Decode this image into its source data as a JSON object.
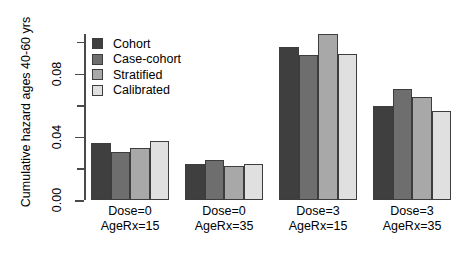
{
  "chart_data": {
    "type": "bar",
    "title": "",
    "xlabel": "",
    "ylabel": "Cumulative hazard ages 40-60 yrs",
    "ylim": [
      0.0,
      0.105
    ],
    "yticks": [
      0.0,
      0.02,
      0.04,
      0.06,
      0.08,
      0.1
    ],
    "ytick_labels": [
      "0.00",
      "0.04",
      "0.08"
    ],
    "ytick_labeled_values": [
      0.0,
      0.04,
      0.08
    ],
    "grid": false,
    "legend_position": "top-left",
    "categories": [
      "Dose=0\nAgeRx=15",
      "Dose=0\nAgeRx=35",
      "Dose=3\nAgeRx=15",
      "Dose=3\nAgeRx=35"
    ],
    "category_lines": [
      [
        "Dose=0",
        "AgeRx=15"
      ],
      [
        "Dose=0",
        "AgeRx=35"
      ],
      [
        "Dose=3",
        "AgeRx=15"
      ],
      [
        "Dose=3",
        "AgeRx=35"
      ]
    ],
    "series": [
      {
        "name": "Cohort",
        "color": "#3f3f3f",
        "values": [
          0.036,
          0.0228,
          0.0965,
          0.0595
        ]
      },
      {
        "name": "Case-cohort",
        "color": "#6e6e6e",
        "values": [
          0.0305,
          0.0253,
          0.0915,
          0.07
        ]
      },
      {
        "name": "Stratified",
        "color": "#a8a8a8",
        "values": [
          0.033,
          0.0215,
          0.105,
          0.065
        ]
      },
      {
        "name": "Calibrated",
        "color": "#e0e0e0",
        "values": [
          0.0375,
          0.0228,
          0.0925,
          0.056
        ]
      }
    ]
  },
  "legend": {
    "items": [
      {
        "label": "Cohort",
        "color": "#3f3f3f"
      },
      {
        "label": "Case-cohort",
        "color": "#6e6e6e"
      },
      {
        "label": "Stratified",
        "color": "#a8a8a8"
      },
      {
        "label": "Calibrated",
        "color": "#e0e0e0"
      }
    ]
  },
  "axes": {
    "y_title": "Cumulative hazard ages 40-60 yrs",
    "y_labels": [
      "0.00",
      "0.04",
      "0.08"
    ]
  }
}
